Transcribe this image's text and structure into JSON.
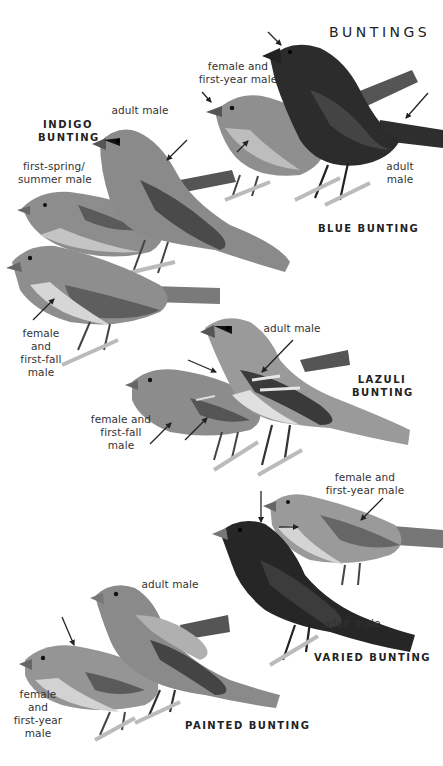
{
  "page": {
    "title": "BUNTINGS"
  },
  "colors": {
    "background": "#ffffff",
    "text": "#2b2b2b",
    "arrow": "#222222",
    "bird_light": "#a8a8a8",
    "bird_mid": "#8a8a8a",
    "bird_dark": "#3a3a3a",
    "bird_darkest": "#262626",
    "belly_light": "#d8d8d8"
  },
  "species": [
    {
      "name": "BLUE BUNTING",
      "labels": [
        "female and first-year male",
        "adult male"
      ]
    },
    {
      "name": "INDIGO BUNTING",
      "name_lines": [
        "INDIGO",
        "BUNTING"
      ],
      "labels": [
        "adult male",
        "first-spring/ summer male",
        "female and first-fall male"
      ]
    },
    {
      "name": "LAZULI BUNTING",
      "name_lines": [
        "LAZULI",
        "BUNTING"
      ],
      "labels": [
        "adult male",
        "female and first-fall male"
      ]
    },
    {
      "name": "VARIED BUNTING",
      "labels": [
        "female and first-year male",
        "adult male"
      ]
    },
    {
      "name": "PAINTED BUNTING",
      "labels": [
        "adult male",
        "female and first-year male"
      ]
    }
  ],
  "text": {
    "blue_female_l1": "female and",
    "blue_female_l2": "first-year male",
    "blue_adult_l1": "adult",
    "blue_adult_l2": "male",
    "blue_name": "BLUE BUNTING",
    "indigo_name_l1": "INDIGO",
    "indigo_name_l2": "BUNTING",
    "indigo_adult": "adult male",
    "indigo_firstspring_l1": "first-spring/",
    "indigo_firstspring_l2": "summer male",
    "indigo_female_l1": "female",
    "indigo_female_l2": "and",
    "indigo_female_l3": "first-fall",
    "indigo_female_l4": "male",
    "lazuli_name_l1": "LAZULI",
    "lazuli_name_l2": "BUNTING",
    "lazuli_adult": "adult male",
    "lazuli_female_l1": "female and",
    "lazuli_female_l2": "first-fall",
    "lazuli_female_l3": "male",
    "varied_female_l1": "female and",
    "varied_female_l2": "first-year male",
    "varied_adult": "adult male",
    "varied_name": "VARIED BUNTING",
    "painted_adult": "adult male",
    "painted_female_l1": "female",
    "painted_female_l2": "and",
    "painted_female_l3": "first-year",
    "painted_female_l4": "male",
    "painted_name": "PAINTED BUNTING"
  }
}
